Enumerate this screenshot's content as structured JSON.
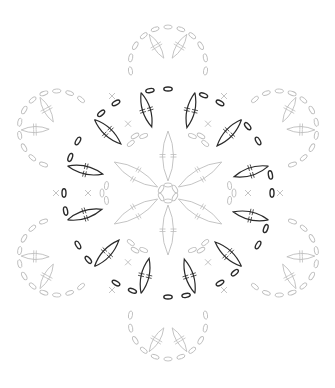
{
  "diagram": {
    "type": "crochet-motif-chart",
    "center": [
      168,
      193
    ],
    "symmetry": 6,
    "colors": {
      "background": "#ffffff",
      "current_round": "#2a2a2a",
      "other_rounds": "#bdbdbd"
    },
    "rounds": {
      "inner_light": {
        "color_key": "other_rounds",
        "petals": 6,
        "petal_inner_r": 12,
        "petal_outer_r": 62
      },
      "dark_ring": {
        "color_key": "current_round",
        "chain_radius": 104,
        "chains_per_segment": 3,
        "petals_per_section": 2,
        "petal_count": 12
      },
      "outer_light": {
        "color_key": "other_rounds",
        "lobes": 6,
        "lobe_radius": 150,
        "petals_per_lobe": 2
      }
    },
    "symbols": [
      "chain-oval",
      "double-crochet-cluster",
      "single-crochet-x"
    ]
  }
}
